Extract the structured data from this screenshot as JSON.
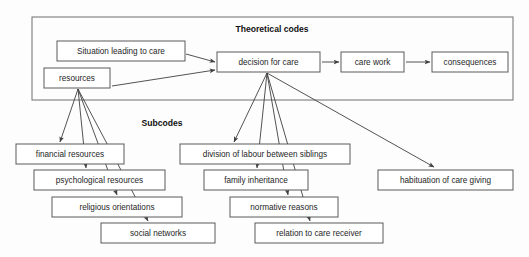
{
  "diagram": {
    "title_sections": [
      {
        "id": "theoretical",
        "label": "Theoretical codes",
        "x": 272,
        "y": 30
      },
      {
        "id": "subcodes",
        "label": "Subcodes",
        "x": 162,
        "y": 124
      }
    ],
    "group_box": {
      "x": 32,
      "y": 17,
      "width": 481,
      "height": 83
    },
    "nodes": [
      {
        "id": "situation",
        "label": "Situation leading to care",
        "x": 57,
        "y": 41,
        "width": 128,
        "height": 20
      },
      {
        "id": "resources",
        "label": "resources",
        "x": 44,
        "y": 68,
        "width": 66,
        "height": 20
      },
      {
        "id": "decision",
        "label": "decision for care",
        "x": 217,
        "y": 52,
        "width": 103,
        "height": 20
      },
      {
        "id": "carework",
        "label": "care work",
        "x": 341,
        "y": 52,
        "width": 63,
        "height": 20
      },
      {
        "id": "consequences",
        "label": "consequences",
        "x": 432,
        "y": 52,
        "width": 76,
        "height": 20
      },
      {
        "id": "financial",
        "label": "financial resources",
        "x": 16,
        "y": 144,
        "width": 108,
        "height": 20
      },
      {
        "id": "psych",
        "label": "psychological resources",
        "x": 34,
        "y": 170,
        "width": 131,
        "height": 20
      },
      {
        "id": "religious",
        "label": "religious orientations",
        "x": 52,
        "y": 197,
        "width": 130,
        "height": 20
      },
      {
        "id": "social",
        "label": "social networks",
        "x": 101,
        "y": 223,
        "width": 114,
        "height": 20
      },
      {
        "id": "division",
        "label": "division of labour between siblings",
        "x": 180,
        "y": 144,
        "width": 170,
        "height": 20
      },
      {
        "id": "inheritance",
        "label": "family inheritance",
        "x": 204,
        "y": 170,
        "width": 104,
        "height": 20
      },
      {
        "id": "normative",
        "label": "normative reasons",
        "x": 230,
        "y": 197,
        "width": 108,
        "height": 20
      },
      {
        "id": "relation",
        "label": "relation to care receiver",
        "x": 255,
        "y": 223,
        "width": 128,
        "height": 20
      },
      {
        "id": "habituation",
        "label": "habituation of care giving",
        "x": 378,
        "y": 170,
        "width": 135,
        "height": 20
      }
    ],
    "edges": [
      {
        "id": "situation-to-decision",
        "from": "situation",
        "to": "decision",
        "x1": 186,
        "y1": 54,
        "x2": 215,
        "y2": 62
      },
      {
        "id": "resources-to-decision",
        "from": "resources",
        "to": "decision",
        "x1": 112,
        "y1": 86,
        "x2": 215,
        "y2": 70
      },
      {
        "id": "decision-to-carework",
        "from": "decision",
        "to": "carework",
        "x1": 322,
        "y1": 62,
        "x2": 339,
        "y2": 62
      },
      {
        "id": "carework-to-consequences",
        "from": "carework",
        "to": "consequences",
        "x1": 406,
        "y1": 62,
        "x2": 430,
        "y2": 62
      },
      {
        "id": "resources-to-financial",
        "from": "resources",
        "to": "financial",
        "x1": 78,
        "y1": 89,
        "x2": 60,
        "y2": 142
      },
      {
        "id": "resources-to-psych",
        "from": "resources",
        "to": "psych",
        "x1": 78,
        "y1": 89,
        "x2": 86,
        "y2": 168
      },
      {
        "id": "resources-to-religious",
        "from": "resources",
        "to": "religious",
        "x1": 78,
        "y1": 89,
        "x2": 117,
        "y2": 195
      },
      {
        "id": "resources-to-social",
        "from": "resources",
        "to": "social",
        "x1": 78,
        "y1": 89,
        "x2": 148,
        "y2": 221
      },
      {
        "id": "decision-to-division",
        "from": "decision",
        "to": "division",
        "x1": 267,
        "y1": 73,
        "x2": 234,
        "y2": 142
      },
      {
        "id": "decision-to-inheritance",
        "from": "decision",
        "to": "inheritance",
        "x1": 267,
        "y1": 73,
        "x2": 257,
        "y2": 168
      },
      {
        "id": "decision-to-normative",
        "from": "decision",
        "to": "normative",
        "x1": 267,
        "y1": 73,
        "x2": 288,
        "y2": 195
      },
      {
        "id": "decision-to-relation",
        "from": "decision",
        "to": "relation",
        "x1": 267,
        "y1": 73,
        "x2": 310,
        "y2": 221
      },
      {
        "id": "decision-to-habituation",
        "from": "decision",
        "to": "habituation",
        "x1": 267,
        "y1": 73,
        "x2": 434,
        "y2": 167
      }
    ],
    "colors": {
      "box_border": "#5a5a5a",
      "group_border": "#6e6e6e",
      "edge": "#3f3f3f",
      "text": "#1e1e1e",
      "background": "#fdfdfd"
    }
  }
}
